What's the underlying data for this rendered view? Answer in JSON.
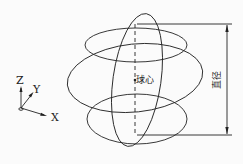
{
  "labels": {
    "axis_z": "Z",
    "axis_y": "Y",
    "axis_x": "X",
    "center": "球心",
    "diameter": "直径"
  },
  "colors": {
    "line": "#222222",
    "background": "#fbfbfb"
  }
}
